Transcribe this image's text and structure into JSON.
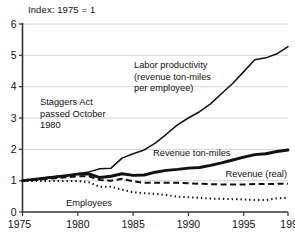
{
  "chart_data": {
    "type": "line",
    "title": "Index: 1975 = 1",
    "xlabel": "",
    "ylabel": "",
    "xlim": [
      1975,
      1999
    ],
    "ylim": [
      0,
      6
    ],
    "grid": true,
    "legend_position": "inline-annotations",
    "x_ticks": [
      "1975",
      "1980",
      "1985",
      "1990",
      "1995",
      "1999"
    ],
    "y_ticks": [
      "0",
      "1",
      "2",
      "3",
      "4",
      "5",
      "6"
    ],
    "x": [
      1975,
      1976,
      1977,
      1978,
      1979,
      1980,
      1981,
      1982,
      1983,
      1984,
      1985,
      1986,
      1987,
      1988,
      1989,
      1990,
      1991,
      1992,
      1993,
      1994,
      1995,
      1996,
      1997,
      1998,
      1999
    ],
    "series": [
      {
        "name": "Labor productivity (revenue ton-miles per employee)",
        "style": "solid-thin",
        "values": [
          1.0,
          1.04,
          1.09,
          1.13,
          1.17,
          1.22,
          1.28,
          1.38,
          1.4,
          1.72,
          1.86,
          1.98,
          2.2,
          2.48,
          2.78,
          3.0,
          3.2,
          3.45,
          3.78,
          4.1,
          4.48,
          4.86,
          4.92,
          5.05,
          5.28
        ]
      },
      {
        "name": "Revenue ton-miles",
        "style": "solid-thick",
        "values": [
          1.0,
          1.04,
          1.08,
          1.12,
          1.16,
          1.21,
          1.22,
          1.1,
          1.14,
          1.22,
          1.17,
          1.18,
          1.27,
          1.33,
          1.36,
          1.4,
          1.42,
          1.49,
          1.57,
          1.66,
          1.75,
          1.83,
          1.86,
          1.93,
          1.98
        ]
      },
      {
        "name": "Revenue (real)",
        "style": "dashed",
        "values": [
          1.0,
          1.02,
          1.05,
          1.08,
          1.11,
          1.14,
          1.14,
          1.02,
          1.0,
          1.06,
          0.98,
          0.93,
          0.93,
          0.93,
          0.93,
          0.92,
          0.9,
          0.89,
          0.88,
          0.88,
          0.88,
          0.89,
          0.89,
          0.9,
          0.9
        ]
      },
      {
        "name": "Employees",
        "style": "dotted",
        "values": [
          1.0,
          0.99,
          0.99,
          0.99,
          0.99,
          0.99,
          0.95,
          0.8,
          0.81,
          0.71,
          0.63,
          0.6,
          0.58,
          0.54,
          0.49,
          0.47,
          0.45,
          0.43,
          0.42,
          0.41,
          0.4,
          0.38,
          0.38,
          0.44,
          0.45
        ]
      }
    ],
    "annotations": [
      {
        "id": "staggers-act",
        "lines": [
          "Staggers Act",
          "passed October",
          "1980"
        ]
      },
      {
        "id": "labor-productivity",
        "lines": [
          "Labor productivity",
          "(revenue ton-miles",
          "per employee)"
        ]
      },
      {
        "id": "revenue-ton-miles",
        "lines": [
          "Revenue ton-miles"
        ]
      },
      {
        "id": "revenue-real",
        "lines": [
          "Revenue (real)"
        ]
      },
      {
        "id": "employees",
        "lines": [
          "Employees"
        ]
      }
    ],
    "colors": {
      "line": "#111111",
      "grid": "#c9c9c9",
      "axis": "#333333",
      "background": "#ffffff"
    }
  }
}
